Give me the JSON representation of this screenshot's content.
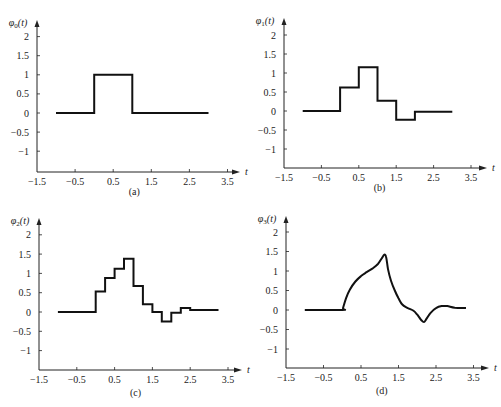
{
  "chart_data": [
    {
      "type": "line",
      "panel": "(a)",
      "caption": "(a)",
      "ylabel": "φ0(t)",
      "ylabel_base": "φ",
      "ylabel_sub": "0",
      "ylabel_tail": "(t)",
      "xlabel": "t",
      "xlim": [
        -1.5,
        3.8
      ],
      "ylim": [
        -1.5,
        2.3
      ],
      "xticks": [
        -1.5,
        -0.5,
        0.5,
        1.5,
        2.5,
        3.5
      ],
      "xtick_labels": [
        "−1.5",
        "−0.5",
        "0.5",
        "1.5",
        "2.5",
        "3.5"
      ],
      "yticks": [
        2,
        1.5,
        1,
        0.5,
        0,
        -0.5,
        -1
      ],
      "ytick_labels": [
        "2",
        "1.5",
        "1",
        "0.5",
        "0",
        "−0.5",
        "−1"
      ],
      "step": true,
      "series": [
        {
          "name": "φ0(t)",
          "points": [
            [
              -1.0,
              0
            ],
            [
              0,
              0
            ],
            [
              0,
              1
            ],
            [
              1,
              1
            ],
            [
              1,
              0
            ],
            [
              3.0,
              0
            ]
          ]
        }
      ]
    },
    {
      "type": "line",
      "panel": "(b)",
      "caption": "(b)",
      "ylabel": "φ1(t)",
      "ylabel_base": "φ",
      "ylabel_sub": "1",
      "ylabel_tail": "(t)",
      "xlabel": "t",
      "xlim": [
        -1.5,
        3.8
      ],
      "ylim": [
        -1.5,
        2.3
      ],
      "xticks": [
        -1.5,
        -0.5,
        0.5,
        1.5,
        2.5,
        3.5
      ],
      "xtick_labels": [
        "−1.5",
        "−0.5",
        "0.5",
        "1.5",
        "2.5",
        "3.5"
      ],
      "yticks": [
        2,
        1.5,
        1,
        0.5,
        0,
        -0.5,
        -1
      ],
      "ytick_labels": [
        "2",
        "1.5",
        "1",
        "0.5",
        "0",
        "−0.5",
        "−1"
      ],
      "step": true,
      "series": [
        {
          "name": "φ1(t)",
          "points": [
            [
              -1.0,
              0
            ],
            [
              0,
              0
            ],
            [
              0,
              0.62
            ],
            [
              0.5,
              0.62
            ],
            [
              0.5,
              1.15
            ],
            [
              1.0,
              1.15
            ],
            [
              1.0,
              0.27
            ],
            [
              1.5,
              0.27
            ],
            [
              1.5,
              -0.23
            ],
            [
              2.0,
              -0.23
            ],
            [
              2.0,
              -0.02
            ],
            [
              3.0,
              -0.02
            ]
          ]
        }
      ]
    },
    {
      "type": "line",
      "panel": "(c)",
      "caption": "(c)",
      "ylabel": "φ2(t)",
      "ylabel_base": "φ",
      "ylabel_sub": "2",
      "ylabel_tail": "(t)",
      "xlabel": "t",
      "xlim": [
        -1.5,
        3.8
      ],
      "ylim": [
        -1.5,
        2.3
      ],
      "xticks": [
        -1.5,
        -0.5,
        0.5,
        1.5,
        2.5,
        3.5
      ],
      "xtick_labels": [
        "−1.5",
        "−0.5",
        "0.5",
        "1.5",
        "2.5",
        "3.5"
      ],
      "yticks": [
        2,
        1.5,
        1,
        0.5,
        0,
        -0.5,
        -1
      ],
      "ytick_labels": [
        "2",
        "1.5",
        "1",
        "0.5",
        "0",
        "−0.5",
        "−1"
      ],
      "step": true,
      "series": [
        {
          "name": "φ2(t)",
          "points": [
            [
              -1.0,
              0
            ],
            [
              0,
              0
            ],
            [
              0,
              0.53
            ],
            [
              0.25,
              0.53
            ],
            [
              0.25,
              0.88
            ],
            [
              0.5,
              0.88
            ],
            [
              0.5,
              1.12
            ],
            [
              0.75,
              1.12
            ],
            [
              0.75,
              1.38
            ],
            [
              1.0,
              1.38
            ],
            [
              1.0,
              0.67
            ],
            [
              1.25,
              0.67
            ],
            [
              1.25,
              0.2
            ],
            [
              1.5,
              0.2
            ],
            [
              1.5,
              0.0
            ],
            [
              1.75,
              0.0
            ],
            [
              1.75,
              -0.25
            ],
            [
              2.0,
              -0.25
            ],
            [
              2.0,
              -0.02
            ],
            [
              2.25,
              -0.02
            ],
            [
              2.25,
              0.1
            ],
            [
              2.5,
              0.1
            ],
            [
              2.5,
              0.05
            ],
            [
              3.25,
              0.05
            ]
          ]
        }
      ]
    },
    {
      "type": "line",
      "panel": "(d)",
      "caption": "(d)",
      "ylabel": "φ3(t)",
      "ylabel_base": "φ",
      "ylabel_sub": "3",
      "ylabel_tail": "(t)",
      "xlabel": "t",
      "xlim": [
        -1.5,
        3.8
      ],
      "ylim": [
        -1.5,
        2.3
      ],
      "xticks": [
        -1.5,
        -0.5,
        0.5,
        1.5,
        2.5,
        3.5
      ],
      "xtick_labels": [
        "−1.5",
        "−0.5",
        "0.5",
        "1.5",
        "2.5",
        "3.5"
      ],
      "yticks": [
        2,
        1.5,
        1,
        0.5,
        0,
        -0.5,
        -1
      ],
      "ytick_labels": [
        "2",
        "1.5",
        "1",
        "0.5",
        "0",
        "−0.5",
        "−1"
      ],
      "step": false,
      "series": [
        {
          "name": "φ3(t)",
          "points": [
            [
              -1.0,
              0
            ],
            [
              0.0,
              0
            ],
            [
              0.02,
              0.05
            ],
            [
              0.1,
              0.3
            ],
            [
              0.2,
              0.52
            ],
            [
              0.35,
              0.73
            ],
            [
              0.5,
              0.87
            ],
            [
              0.65,
              0.97
            ],
            [
              0.8,
              1.06
            ],
            [
              0.95,
              1.18
            ],
            [
              1.05,
              1.32
            ],
            [
              1.12,
              1.42
            ],
            [
              1.17,
              1.36
            ],
            [
              1.22,
              1.05
            ],
            [
              1.3,
              0.75
            ],
            [
              1.4,
              0.5
            ],
            [
              1.5,
              0.3
            ],
            [
              1.6,
              0.14
            ],
            [
              1.75,
              0.05
            ],
            [
              1.9,
              -0.02
            ],
            [
              2.0,
              -0.12
            ],
            [
              2.1,
              -0.25
            ],
            [
              2.18,
              -0.31
            ],
            [
              2.25,
              -0.22
            ],
            [
              2.35,
              -0.08
            ],
            [
              2.5,
              0.05
            ],
            [
              2.65,
              0.1
            ],
            [
              2.8,
              0.1
            ],
            [
              3.0,
              0.06
            ],
            [
              3.3,
              0.05
            ]
          ]
        }
      ]
    }
  ]
}
